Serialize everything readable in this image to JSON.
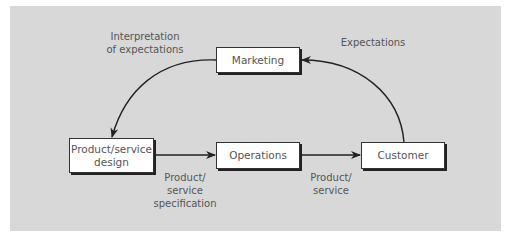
{
  "diagram": {
    "nodes": {
      "marketing": "Marketing",
      "design_line1": "Product/service",
      "design_line2": "design",
      "operations": "Operations",
      "customer": "Customer"
    },
    "edges": {
      "interpretation_line1": "Interpretation",
      "interpretation_line2": "of expectations",
      "expectations": "Expectations",
      "spec_line1": "Product/",
      "spec_line2": "service",
      "spec_line3": "specification",
      "product_line1": "Product/",
      "product_line2": "service"
    },
    "colors": {
      "background": "#d8d8d8",
      "box": "#ffffff",
      "line": "#222222",
      "text": "#555555"
    }
  }
}
